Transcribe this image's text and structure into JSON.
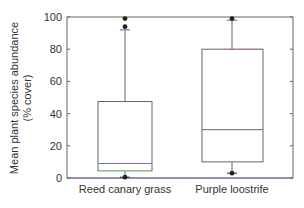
{
  "chart_data": {
    "type": "box",
    "title": "",
    "xlabel": "",
    "ylabel": "Mean plant species abundance",
    "ylabel_line2": "(% cover)",
    "ylim": [
      0,
      100
    ],
    "yticks": [
      0,
      20,
      40,
      60,
      80,
      100
    ],
    "grid": false,
    "legend": null,
    "categories": [
      "Reed canary grass",
      "Purple loostrife"
    ],
    "boxes": [
      {
        "name": "Reed canary grass",
        "whisker_low": 0.5,
        "q1": 4.5,
        "median": 9,
        "q3": 47.5,
        "whisker_high": 92,
        "outliers": [
          99,
          94,
          0.5
        ]
      },
      {
        "name": "Purple loostrife",
        "whisker_low": 3,
        "q1": 10,
        "median": 30,
        "q3": 80,
        "whisker_high": 98,
        "outliers": [
          99,
          3
        ]
      }
    ]
  },
  "colors": {
    "axis": "#555555",
    "box": "#666666",
    "outlier": "#222222",
    "median_box1": "#7a6fb0",
    "q1_box1": "#8fd18a",
    "q3_box2": "#d9577a"
  }
}
